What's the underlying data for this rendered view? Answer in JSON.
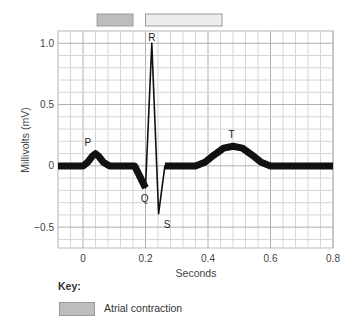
{
  "chart_data": {
    "type": "line",
    "title": "",
    "xlabel": "Seconds",
    "ylabel": "Millivolts (mV)",
    "xlim": [
      -0.08,
      0.8
    ],
    "ylim": [
      -0.67,
      1.1
    ],
    "grid": true,
    "x_ticks": [
      0,
      0.2,
      0.4,
      0.6,
      0.8
    ],
    "x_tick_labels": [
      "0",
      "0.2",
      "0.4",
      "0.6",
      "0.8"
    ],
    "y_ticks": [
      1.0,
      0.5,
      0,
      -0.5
    ],
    "y_tick_labels": [
      "1.0",
      "0.5",
      "0",
      "−0.5"
    ],
    "series": [
      {
        "name": "ECG trace",
        "segments": [
          {
            "style": "thick",
            "points": [
              [
                -0.08,
                0
              ],
              [
                0,
                0
              ],
              [
                0.015,
                0.03
              ],
              [
                0.03,
                0.08
              ],
              [
                0.04,
                0.1
              ],
              [
                0.05,
                0.08
              ],
              [
                0.065,
                0.03
              ],
              [
                0.085,
                0
              ],
              [
                0.165,
                0
              ],
              [
                0.2,
                -0.18
              ]
            ]
          },
          {
            "style": "thin",
            "points": [
              [
                0.2,
                -0.18
              ],
              [
                0.22,
                1.0
              ],
              [
                0.242,
                -0.39
              ],
              [
                0.262,
                0
              ]
            ]
          },
          {
            "style": "thick",
            "points": [
              [
                0.262,
                0
              ],
              [
                0.36,
                0
              ],
              [
                0.39,
                0.03
              ],
              [
                0.42,
                0.09
              ],
              [
                0.45,
                0.145
              ],
              [
                0.48,
                0.16
              ],
              [
                0.51,
                0.145
              ],
              [
                0.54,
                0.09
              ],
              [
                0.57,
                0.03
              ],
              [
                0.6,
                0
              ],
              [
                0.8,
                0
              ]
            ]
          }
        ]
      }
    ],
    "annotations": [
      {
        "text": "P",
        "x": 0.035,
        "y": 0.1
      },
      {
        "text": "Q",
        "x": 0.197,
        "y": -0.18
      },
      {
        "text": "R",
        "x": 0.22,
        "y": 1.0
      },
      {
        "text": "S",
        "x": 0.25,
        "y": -0.39
      },
      {
        "text": "T",
        "x": 0.475,
        "y": 0.16
      }
    ],
    "interval_bars": [
      {
        "name": "Atrial contraction",
        "start": 0.045,
        "end": 0.16,
        "color": "#bdbdbd"
      },
      {
        "name": "Ventricular contraction",
        "start": 0.2,
        "end": 0.445,
        "color": "#ececec"
      }
    ],
    "legend": {
      "title": "Key:",
      "placement": "bottom-left",
      "entries": [
        {
          "label": "Atrial contraction",
          "color": "#bdbdbd"
        }
      ]
    }
  },
  "key": {
    "title": "Key:",
    "entries": [
      {
        "label": "Atrial contraction"
      }
    ]
  }
}
